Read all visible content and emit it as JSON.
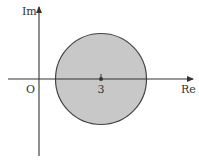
{
  "diagram": {
    "type": "complex-plane",
    "axes": {
      "vertical_label": "Im",
      "horizontal_label": "Re",
      "origin_label": "O"
    },
    "disk": {
      "center_label": "3",
      "center_re": 3,
      "fill": "#c8c8c8",
      "stroke": "#444444"
    }
  }
}
